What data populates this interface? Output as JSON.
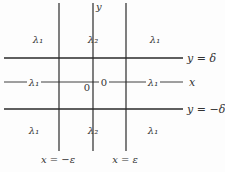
{
  "diagram": {
    "lines": {
      "y_delta": {
        "label": "y = δ"
      },
      "x_axis": {
        "label": "x"
      },
      "y_neg_delta": {
        "label": "y = −δ"
      },
      "x_neg_eps": {
        "label": "x = −ε"
      },
      "y_axis": {
        "label": "y"
      },
      "x_eps": {
        "label": "x = ε"
      }
    },
    "origin_label": "0",
    "axis_zero_label": "0",
    "regions": {
      "top_left": "λ₁",
      "top_center": "λ₂",
      "top_right": "λ₁",
      "middle_left": "λ₁",
      "middle_right": "λ₁",
      "bottom_left": "λ₁",
      "bottom_center": "λ₂",
      "bottom_right": "λ₁"
    },
    "colors": {
      "ink": "#2a2a2a",
      "background": "#fdfdfd"
    }
  }
}
